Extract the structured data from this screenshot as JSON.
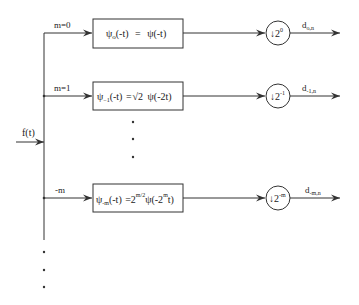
{
  "diagram": {
    "type": "wavelet filter bank block diagram",
    "input": {
      "label": "f(t)"
    },
    "branches": [
      {
        "branch_label": "m=0",
        "filter": {
          "lhs": "ψ",
          "lhs_sub": "o",
          "lhs_arg": "(-t)",
          "eq": "=",
          "rhs": "ψ(-t)"
        },
        "downsampler": {
          "symbol": "↓2",
          "exp": "0"
        },
        "output": {
          "base": "d",
          "sub": "o,n"
        }
      },
      {
        "branch_label": "m=1",
        "filter": {
          "lhs": "ψ",
          "lhs_sub": "−1",
          "lhs_arg": "(-t)",
          "eq": "=",
          "rhs_sqrt": "√2",
          "rhs": "ψ(-2t)"
        },
        "downsampler": {
          "symbol": "↓2",
          "exp": "-1"
        },
        "output": {
          "base": "d",
          "sub": "-1,n"
        }
      },
      {
        "branch_label": "-m",
        "filter": {
          "lhs": "ψ",
          "lhs_sub": "-m",
          "lhs_arg": "(-t)",
          "eq": "=",
          "rhs_coef": "2",
          "rhs_coef_exp": "m/2",
          "rhs_pre": "ψ(-2",
          "rhs_exp": "m",
          "rhs_post": "t)"
        },
        "downsampler": {
          "symbol": "↓2",
          "exp": "-m"
        },
        "output": {
          "base": "d",
          "sub": "-m,n"
        }
      }
    ],
    "ellipsis": "⋮"
  }
}
